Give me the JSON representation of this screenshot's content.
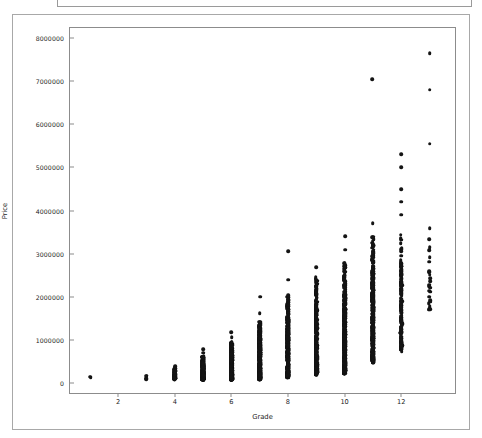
{
  "figure": {
    "background_color": "#ffffff",
    "frame_color": "#a8a8a8",
    "marker_color": "#141414"
  },
  "chart_data": {
    "type": "scatter",
    "title": "",
    "xlabel": "Grade",
    "ylabel": "Price",
    "xlim": [
      0.3,
      13.9
    ],
    "ylim": [
      -230000,
      8230000
    ],
    "grid": false,
    "legend": null,
    "xticks": [
      2,
      4,
      6,
      8,
      10,
      12
    ],
    "xtick_labels": [
      "2",
      "4",
      "6",
      "8",
      "10",
      "12"
    ],
    "yticks": [
      0,
      1000000,
      2000000,
      3000000,
      4000000,
      5000000,
      6000000,
      7000000,
      8000000
    ],
    "ytick_labels": [
      "0",
      "1000000",
      "2000000",
      "3000000",
      "4000000",
      "5000000",
      "6000000",
      "7000000",
      "8000000"
    ],
    "marker": "circle",
    "marker_size": 3.6,
    "columns": [
      {
        "grade": 1,
        "count": 1,
        "min": 140000,
        "max": 150000,
        "dense_min": 140000,
        "dense_max": 150000,
        "outliers": []
      },
      {
        "grade": 3,
        "count": 2,
        "min": 80000,
        "max": 230000,
        "dense_min": 80000,
        "dense_max": 230000,
        "outliers": []
      },
      {
        "grade": 4,
        "count": 28,
        "min": 90000,
        "max": 430000,
        "dense_min": 90000,
        "dense_max": 400000,
        "outliers": []
      },
      {
        "grade": 5,
        "count": 230,
        "min": 80000,
        "max": 780000,
        "dense_min": 80000,
        "dense_max": 620000,
        "outliers": [
          700000,
          780000
        ]
      },
      {
        "grade": 6,
        "count": 870,
        "min": 90000,
        "max": 1180000,
        "dense_min": 90000,
        "dense_max": 960000,
        "outliers": [
          1060000,
          1180000
        ]
      },
      {
        "grade": 7,
        "count": 1600,
        "min": 100000,
        "max": 2000000,
        "dense_min": 100000,
        "dense_max": 1420000,
        "outliers": [
          1620000,
          2000000
        ]
      },
      {
        "grade": 8,
        "count": 1400,
        "min": 140000,
        "max": 3050000,
        "dense_min": 150000,
        "dense_max": 2030000,
        "outliers": [
          2400000,
          3050000
        ]
      },
      {
        "grade": 9,
        "count": 900,
        "min": 190000,
        "max": 2680000,
        "dense_min": 210000,
        "dense_max": 2460000,
        "outliers": [
          2680000
        ]
      },
      {
        "grade": 10,
        "count": 520,
        "min": 220000,
        "max": 3400000,
        "dense_min": 250000,
        "dense_max": 2780000,
        "outliers": [
          3090000,
          3400000
        ]
      },
      {
        "grade": 11,
        "count": 230,
        "min": 390000,
        "max": 7050000,
        "dense_min": 510000,
        "dense_max": 3400000,
        "outliers": [
          3700000,
          7050000
        ]
      },
      {
        "grade": 12,
        "count": 80,
        "min": 750000,
        "max": 5300000,
        "dense_min": 780000,
        "dense_max": 3500000,
        "outliers": [
          3900000,
          4200000,
          4500000,
          5000000,
          5300000
        ]
      },
      {
        "grade": 13,
        "count": 13,
        "min": 1700000,
        "max": 7650000,
        "dense_min": 1700000,
        "dense_max": 3750000,
        "outliers": [
          5550000,
          6800000,
          7650000
        ]
      }
    ]
  }
}
